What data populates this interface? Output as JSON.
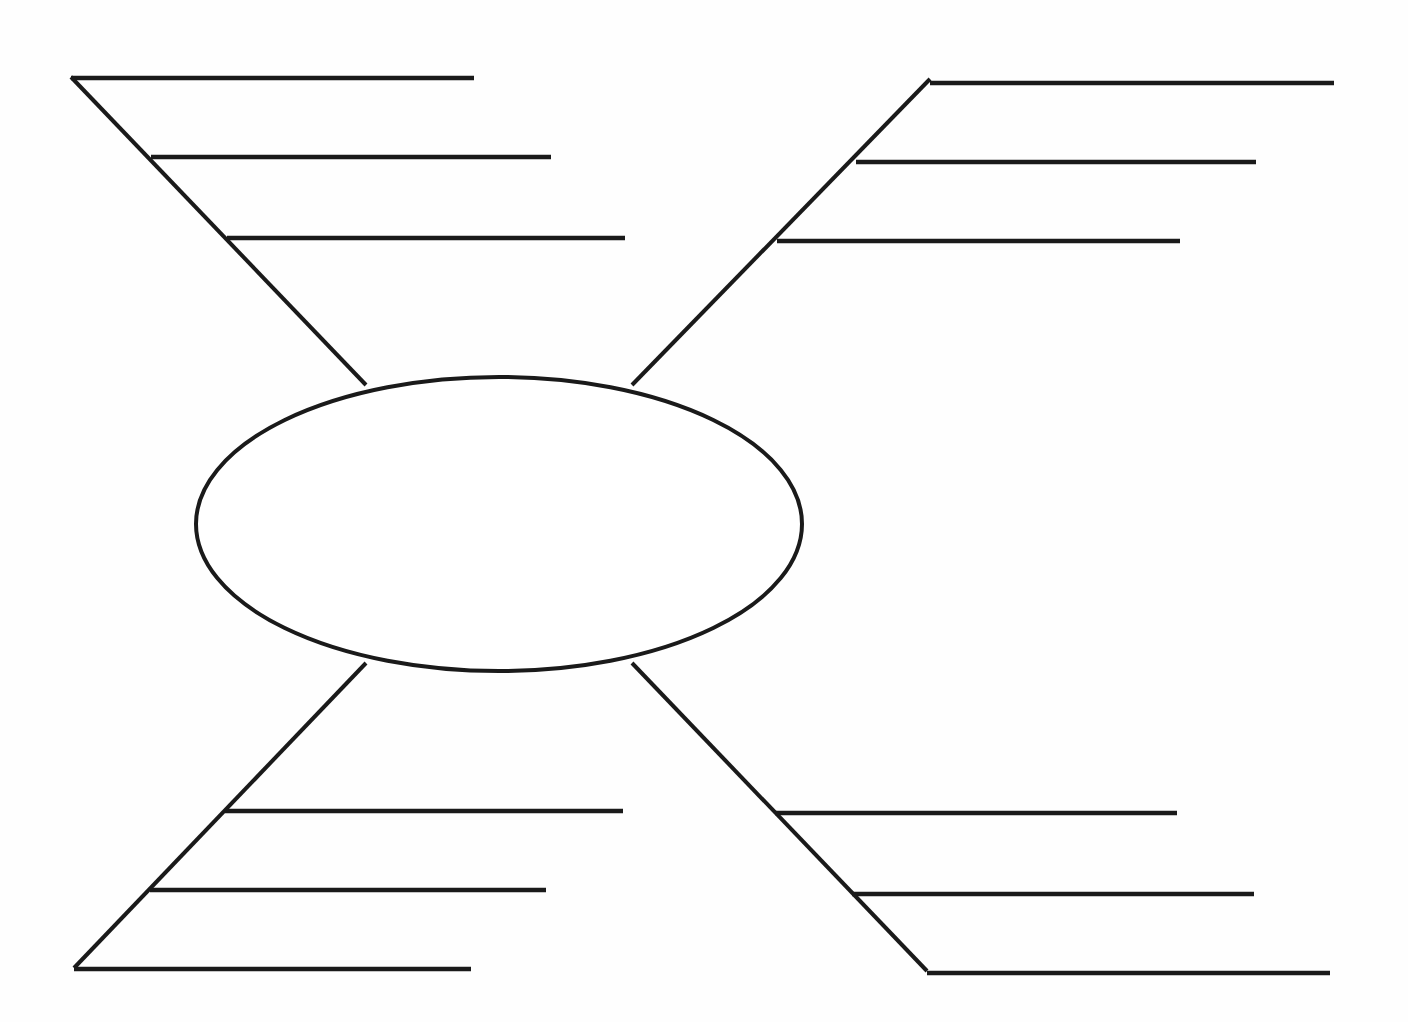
{
  "document": {
    "type": "blank-graphic-organizer",
    "title": "",
    "background_color": "#fefefe",
    "line_color": "#1a1a1a",
    "canvas": {
      "width": 1408,
      "height": 1022
    }
  },
  "center_node": {
    "label": "",
    "shape": "ellipse",
    "cx": 499,
    "cy": 524,
    "rx": 303,
    "ry": 147,
    "fill": "#ffffff",
    "stroke": "#1a1a1a"
  },
  "branches": [
    {
      "id": "branch-top-left",
      "position": "top-left",
      "label": "",
      "spine": {
        "x1": 71,
        "y1": 77,
        "x2": 366,
        "y2": 385
      },
      "ribs": [
        {
          "id": "rib-tl-1",
          "label": "",
          "x1": 71,
          "y1": 78,
          "x2": 474,
          "y2": 78
        },
        {
          "id": "rib-tl-2",
          "label": "",
          "x1": 151,
          "y1": 157,
          "x2": 551,
          "y2": 157
        },
        {
          "id": "rib-tl-3",
          "label": "",
          "x1": 227,
          "y1": 238,
          "x2": 625,
          "y2": 238
        }
      ]
    },
    {
      "id": "branch-top-right",
      "position": "top-right",
      "label": "",
      "spine": {
        "x1": 930,
        "y1": 79,
        "x2": 632,
        "y2": 385
      },
      "ribs": [
        {
          "id": "rib-tr-1",
          "label": "",
          "x1": 930,
          "y1": 83,
          "x2": 1334,
          "y2": 83
        },
        {
          "id": "rib-tr-2",
          "label": "",
          "x1": 856,
          "y1": 162,
          "x2": 1256,
          "y2": 162
        },
        {
          "id": "rib-tr-3",
          "label": "",
          "x1": 777,
          "y1": 241,
          "x2": 1180,
          "y2": 241
        }
      ]
    },
    {
      "id": "branch-bottom-left",
      "position": "bottom-left",
      "label": "",
      "spine": {
        "x1": 366,
        "y1": 663,
        "x2": 74,
        "y2": 968
      },
      "ribs": [
        {
          "id": "rib-bl-1",
          "label": "",
          "x1": 225,
          "y1": 811,
          "x2": 623,
          "y2": 811
        },
        {
          "id": "rib-bl-2",
          "label": "",
          "x1": 150,
          "y1": 890,
          "x2": 546,
          "y2": 890
        },
        {
          "id": "rib-bl-3",
          "label": "",
          "x1": 74,
          "y1": 969,
          "x2": 471,
          "y2": 969
        }
      ]
    },
    {
      "id": "branch-bottom-right",
      "position": "bottom-right",
      "label": "",
      "spine": {
        "x1": 632,
        "y1": 663,
        "x2": 927,
        "y2": 971
      },
      "ribs": [
        {
          "id": "rib-br-1",
          "label": "",
          "x1": 775,
          "y1": 813,
          "x2": 1177,
          "y2": 813
        },
        {
          "id": "rib-br-2",
          "label": "",
          "x1": 852,
          "y1": 894,
          "x2": 1254,
          "y2": 894
        },
        {
          "id": "rib-br-3",
          "label": "",
          "x1": 927,
          "y1": 973,
          "x2": 1330,
          "y2": 973
        }
      ]
    }
  ]
}
